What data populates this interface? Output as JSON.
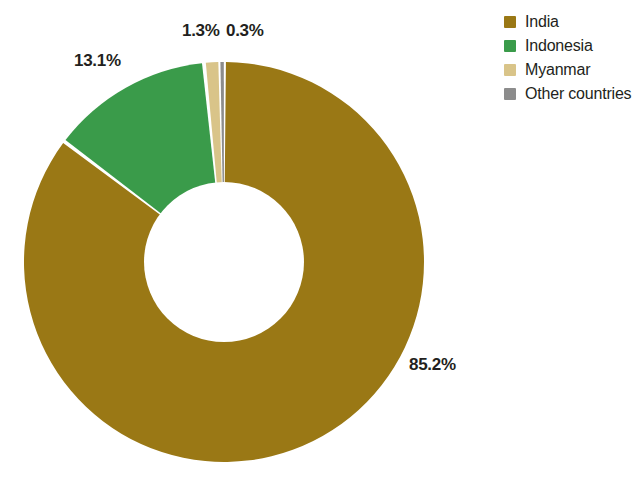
{
  "chart_data": {
    "type": "pie",
    "variant": "donut",
    "title": "",
    "subtitle": "",
    "xlabel": "",
    "ylabel": "",
    "grid": false,
    "legend_position": "top-right",
    "start_angle_deg": 0,
    "direction": "clockwise",
    "units": "percent",
    "categories": [
      "India",
      "Indonesia",
      "Myanmar",
      "Other countries"
    ],
    "values": [
      85.2,
      13.1,
      1.3,
      0.3
    ],
    "value_labels": [
      "85.2%",
      "13.1%",
      "1.3%",
      "0.3%"
    ],
    "colors": [
      "#9a7815",
      "#3a9b4a",
      "#d9c489",
      "#8c8c8c"
    ],
    "slices": [
      {
        "name": "India",
        "value": 85.2,
        "label": "85.2%",
        "color": "#9a7815"
      },
      {
        "name": "Indonesia",
        "value": 13.1,
        "label": "13.1%",
        "color": "#3a9b4a"
      },
      {
        "name": "Myanmar",
        "value": 1.3,
        "label": "1.3%",
        "color": "#d9c489"
      },
      {
        "name": "Other countries",
        "value": 0.3,
        "label": "0.3%",
        "color": "#8c8c8c"
      }
    ]
  },
  "legend": {
    "items": [
      {
        "label": "India",
        "color": "#9a7815"
      },
      {
        "label": "Indonesia",
        "color": "#3a9b4a"
      },
      {
        "label": "Myanmar",
        "color": "#d9c489"
      },
      {
        "label": "Other countries",
        "color": "#8c8c8c"
      }
    ]
  },
  "labels": {
    "india": "85.2%",
    "indonesia": "13.1%",
    "myanmar": "1.3%",
    "other": "0.3%"
  },
  "style": {
    "background": "#ffffff",
    "text_color": "#231f20",
    "slice_gap_color": "#ffffff"
  }
}
